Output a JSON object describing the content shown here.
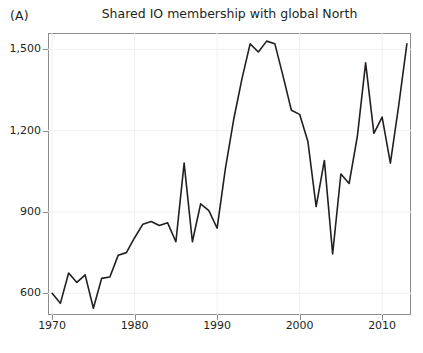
{
  "panel": {
    "label": "(A)"
  },
  "chart_data": {
    "type": "line",
    "title": "Shared IO membership with global North",
    "xlabel": "",
    "ylabel": "",
    "xlim": [
      1969,
      1914
    ],
    "x_range": [
      1969.5,
      2013.5
    ],
    "ylim": [
      520,
      1560
    ],
    "grid": true,
    "grid_color": "#f0f0f0",
    "legend": null,
    "line_color": "#231f20",
    "line_width": 1.6,
    "axis_color": "#8c8c8c",
    "x_ticks": [
      1970,
      1980,
      1990,
      2000,
      2010
    ],
    "x_tick_labels": [
      "1970",
      "1980",
      "1990",
      "2000",
      "2010"
    ],
    "y_ticks": [
      600,
      900,
      1200,
      1500
    ],
    "y_tick_labels": [
      "600",
      "900",
      "1,200",
      "1,500"
    ],
    "x": [
      1970,
      1971,
      1972,
      1973,
      1974,
      1975,
      1976,
      1977,
      1978,
      1979,
      1980,
      1981,
      1982,
      1983,
      1984,
      1985,
      1986,
      1987,
      1988,
      1989,
      1990,
      1991,
      1992,
      1993,
      1994,
      1995,
      1996,
      1997,
      1998,
      1999,
      2000,
      2001,
      2002,
      2003,
      2004,
      2005,
      2006,
      2007,
      2008,
      2009,
      2010,
      2011,
      2012,
      2013
    ],
    "values": [
      600,
      563,
      675,
      640,
      668,
      545,
      655,
      660,
      740,
      750,
      805,
      855,
      865,
      850,
      860,
      790,
      1080,
      790,
      930,
      905,
      840,
      1060,
      1240,
      1390,
      1520,
      1490,
      1530,
      1520,
      1400,
      1275,
      1260,
      1160,
      920,
      1090,
      745,
      1040,
      1005,
      1180,
      1450,
      1190,
      1250,
      1080,
      1290,
      1520
    ],
    "series_name": "Shared IO membership with global North"
  }
}
